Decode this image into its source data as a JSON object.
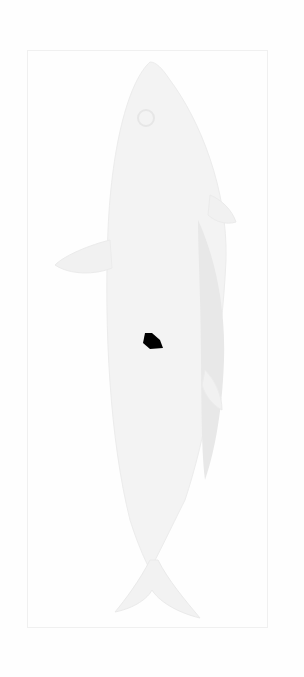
{
  "image": {
    "subject": "faint engraved illustration of a fish, viewed from the side, oriented vertically with head at top and tail at bottom",
    "background_color": "#fefefe",
    "frame_color": "#efefef",
    "fish_body_color": "#f1f1f1",
    "fish_dorsal_band_color": "#e9e9e9",
    "blot_color": "#000000"
  }
}
